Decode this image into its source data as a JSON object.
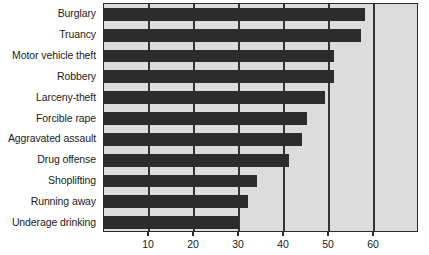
{
  "chart_data": {
    "type": "bar",
    "orientation": "horizontal",
    "title": "",
    "subtitle": "",
    "xlabel": "",
    "ylabel": "",
    "categories": [
      "Burglary",
      "Truancy",
      "Motor vehicle theft",
      "Robbery",
      "Larceny-theft",
      "Forcible rape",
      "Aggravated assault",
      "Drug offense",
      "Shoplifting",
      "Running away",
      "Underage drinking"
    ],
    "values": [
      58,
      57,
      51,
      51,
      49,
      45,
      44,
      41,
      34,
      32,
      30
    ],
    "xlim": [
      0,
      70
    ],
    "xticks": [
      10,
      20,
      30,
      40,
      50,
      60
    ],
    "xticklabels": [
      "10",
      "20",
      "30",
      "40",
      "50",
      "60"
    ],
    "grid": true,
    "grid_axis": "x",
    "legend": false,
    "legend_position": "none",
    "colors": {
      "bar": "#2c2c2c",
      "plot_background": "#dcdcdc",
      "gridline": "#33333a",
      "axis": "#2b2b2b",
      "text": "#1b1b1b",
      "page_background": "#ffffff"
    }
  }
}
